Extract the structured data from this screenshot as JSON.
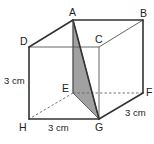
{
  "figure": {
    "type": "cube",
    "vertices": {
      "A": {
        "label": "A"
      },
      "B": {
        "label": "B"
      },
      "C": {
        "label": "C"
      },
      "D": {
        "label": "D"
      },
      "E": {
        "label": "E"
      },
      "F": {
        "label": "F"
      },
      "G": {
        "label": "G"
      },
      "H": {
        "label": "H"
      }
    },
    "shaded_face": "AEG",
    "hidden_edges": [
      "EH",
      "EF"
    ],
    "dimensions": {
      "height": "3 cm",
      "width": "3 cm",
      "depth": "3 cm"
    },
    "colors": {
      "edge": "#333333",
      "shade": "#a9a9a9"
    }
  }
}
